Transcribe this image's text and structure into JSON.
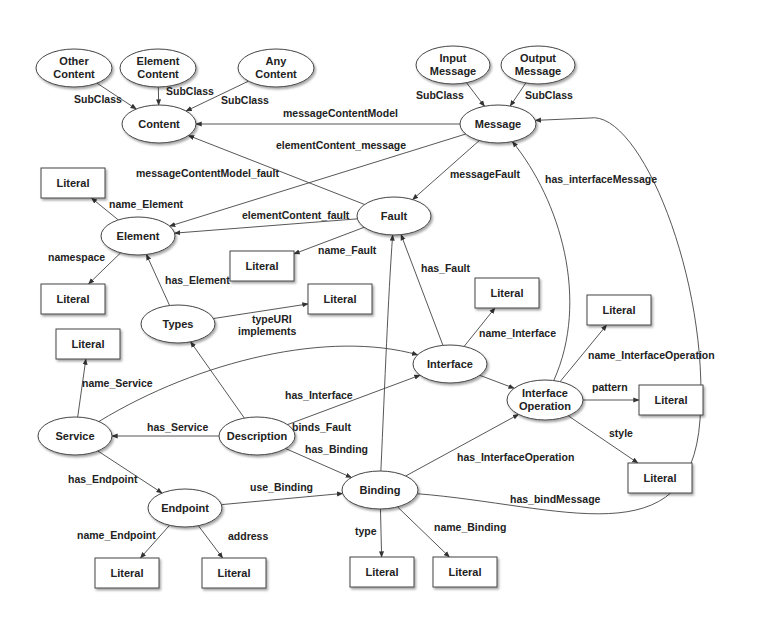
{
  "diagram": {
    "title": "",
    "nodes": [
      {
        "id": "other_content",
        "shape": "ellipse",
        "lines": [
          "Other",
          "Content"
        ]
      },
      {
        "id": "element_content",
        "shape": "ellipse",
        "lines": [
          "Element",
          "Content"
        ]
      },
      {
        "id": "any_content",
        "shape": "ellipse",
        "lines": [
          "Any",
          "Content"
        ]
      },
      {
        "id": "content",
        "shape": "ellipse",
        "lines": [
          "Content"
        ]
      },
      {
        "id": "input_message",
        "shape": "ellipse",
        "lines": [
          "Input",
          "Message"
        ]
      },
      {
        "id": "output_message",
        "shape": "ellipse",
        "lines": [
          "Output",
          "Message"
        ]
      },
      {
        "id": "message",
        "shape": "ellipse",
        "lines": [
          "Message"
        ]
      },
      {
        "id": "element",
        "shape": "ellipse",
        "lines": [
          "Element"
        ]
      },
      {
        "id": "fault",
        "shape": "ellipse",
        "lines": [
          "Fault"
        ]
      },
      {
        "id": "types",
        "shape": "ellipse",
        "lines": [
          "Types"
        ]
      },
      {
        "id": "interface",
        "shape": "ellipse",
        "lines": [
          "Interface"
        ]
      },
      {
        "id": "interface_operation",
        "shape": "ellipse",
        "lines": [
          "Interface",
          "Operation"
        ]
      },
      {
        "id": "service",
        "shape": "ellipse",
        "lines": [
          "Service"
        ]
      },
      {
        "id": "description",
        "shape": "ellipse",
        "lines": [
          "Description"
        ]
      },
      {
        "id": "endpoint",
        "shape": "ellipse",
        "lines": [
          "Endpoint"
        ]
      },
      {
        "id": "binding",
        "shape": "ellipse",
        "lines": [
          "Binding"
        ]
      },
      {
        "id": "lit_name_element",
        "shape": "box",
        "lines": [
          "Literal"
        ]
      },
      {
        "id": "lit_namespace",
        "shape": "box",
        "lines": [
          "Literal"
        ]
      },
      {
        "id": "lit_name_service",
        "shape": "box",
        "lines": [
          "Literal"
        ]
      },
      {
        "id": "lit_name_fault",
        "shape": "box",
        "lines": [
          "Literal"
        ]
      },
      {
        "id": "lit_type_uri",
        "shape": "box",
        "lines": [
          "Literal"
        ]
      },
      {
        "id": "lit_name_interface",
        "shape": "box",
        "lines": [
          "Literal"
        ]
      },
      {
        "id": "lit_name_interface_operation",
        "shape": "box",
        "lines": [
          "Literal"
        ]
      },
      {
        "id": "lit_pattern",
        "shape": "box",
        "lines": [
          "Literal"
        ]
      },
      {
        "id": "lit_style",
        "shape": "box",
        "lines": [
          "Literal"
        ]
      },
      {
        "id": "lit_name_endpoint",
        "shape": "box",
        "lines": [
          "Literal"
        ]
      },
      {
        "id": "lit_address",
        "shape": "box",
        "lines": [
          "Literal"
        ]
      },
      {
        "id": "lit_type",
        "shape": "box",
        "lines": [
          "Literal"
        ]
      },
      {
        "id": "lit_name_binding",
        "shape": "box",
        "lines": [
          "Literal"
        ]
      }
    ],
    "edges": [
      {
        "from": "other_content",
        "to": "content",
        "label": "SubClass"
      },
      {
        "from": "element_content",
        "to": "content",
        "label": "SubClass"
      },
      {
        "from": "any_content",
        "to": "content",
        "label": "SubClass"
      },
      {
        "from": "input_message",
        "to": "message",
        "label": "SubClass"
      },
      {
        "from": "output_message",
        "to": "message",
        "label": "SubClass"
      },
      {
        "from": "message",
        "to": "content",
        "label": "messageContentModel"
      },
      {
        "from": "message",
        "to": "element",
        "label": "elementContent_message"
      },
      {
        "from": "fault",
        "to": "content",
        "label": "messageContentModel_fault"
      },
      {
        "from": "message",
        "to": "fault",
        "label": "messageFault"
      },
      {
        "from": "element",
        "to": "lit_name_element",
        "label": "name_Element"
      },
      {
        "from": "fault",
        "to": "element",
        "label": "elementContent_fault"
      },
      {
        "from": "fault",
        "to": "lit_name_fault",
        "label": "name_Fault"
      },
      {
        "from": "element",
        "to": "lit_namespace",
        "label": "namespace"
      },
      {
        "from": "types",
        "to": "element",
        "label": "has_Element"
      },
      {
        "from": "types",
        "to": "lit_type_uri",
        "label": "typeURI"
      },
      {
        "from": "interface",
        "to": "fault",
        "label": "has_Fault"
      },
      {
        "from": "interface",
        "to": "lit_name_interface",
        "label": "name_Interface"
      },
      {
        "from": "interface_operation",
        "to": "message",
        "label": "has_interfaceMessage"
      },
      {
        "from": "interface_operation",
        "to": "lit_name_interface_operation",
        "label": "name_InterfaceOperation"
      },
      {
        "from": "service",
        "to": "lit_name_service",
        "label": "name_Service"
      },
      {
        "from": "service",
        "to": "interface",
        "label": "implements"
      },
      {
        "from": "description",
        "to": "types",
        "label": ""
      },
      {
        "from": "description",
        "to": "interface",
        "label": "has_Interface"
      },
      {
        "from": "interface",
        "to": "interface_operation",
        "label": ""
      },
      {
        "from": "interface_operation",
        "to": "lit_pattern",
        "label": "pattern"
      },
      {
        "from": "description",
        "to": "service",
        "label": "has_Service"
      },
      {
        "from": "binding",
        "to": "fault",
        "label": "binds_Fault"
      },
      {
        "from": "description",
        "to": "binding",
        "label": "has_Binding"
      },
      {
        "from": "binding",
        "to": "interface_operation",
        "label": "has_InterfaceOperation"
      },
      {
        "from": "interface_operation",
        "to": "lit_style",
        "label": "style"
      },
      {
        "from": "service",
        "to": "endpoint",
        "label": "has_Endpoint"
      },
      {
        "from": "endpoint",
        "to": "binding",
        "label": "use_Binding"
      },
      {
        "from": "binding",
        "to": "message",
        "label": "has_bindMessage"
      },
      {
        "from": "endpoint",
        "to": "lit_name_endpoint",
        "label": "name_Endpoint"
      },
      {
        "from": "endpoint",
        "to": "lit_address",
        "label": "address"
      },
      {
        "from": "binding",
        "to": "lit_type",
        "label": "type"
      },
      {
        "from": "binding",
        "to": "lit_name_binding",
        "label": "name_Binding"
      }
    ]
  }
}
